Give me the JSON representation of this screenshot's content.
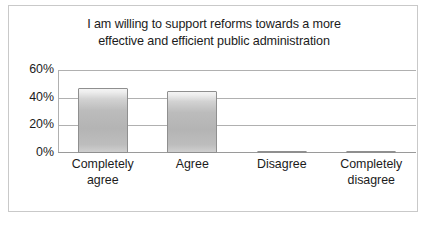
{
  "chart_data": {
    "type": "bar",
    "title": "I am willing to support reforms towards a more effective and efficient public administration",
    "title_lines": [
      "I am willing to support reforms towards a more",
      "effective and efficient public administration"
    ],
    "categories": [
      "Completely agree",
      "Agree",
      "Disagree",
      "Completely disagree"
    ],
    "category_lines": [
      [
        "Completely",
        "agree"
      ],
      [
        "Agree"
      ],
      [
        "Disagree"
      ],
      [
        "Completely",
        "disagree"
      ]
    ],
    "values": [
      47,
      45,
      1,
      1
    ],
    "xlabel": "",
    "ylabel": "",
    "ylim": [
      0,
      60
    ],
    "ytick_values": [
      0,
      20,
      40,
      60
    ],
    "ytick_labels": [
      "0%",
      "20%",
      "40%",
      "60%"
    ],
    "grid": true,
    "grid_axis": "y",
    "legend": false,
    "legend_position": "none",
    "series": [
      {
        "name": "Share of respondents",
        "values": [
          47,
          45,
          1,
          1
        ]
      }
    ],
    "colors": {
      "bar_fill_top": "#f4f4f4",
      "bar_fill_mid": "#b4b4b4",
      "bar_fill_bottom": "#cfcfcf",
      "bar_border": "#8f8f8f",
      "gridline": "#b0b0b0",
      "axis": "#9a9a9a",
      "frame_border": "#c9c9c9",
      "text": "#1b1b1b",
      "background": "#ffffff"
    }
  }
}
